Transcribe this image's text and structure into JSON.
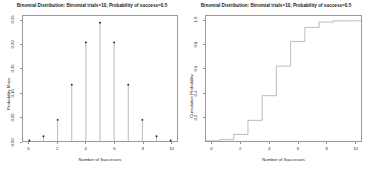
{
  "panels": [
    {
      "title": "Binomial Distribution:  Binomial trials=10, Probability of success=0.5",
      "xlabel": "Number of Successes",
      "ylabel": "Probability Mass"
    },
    {
      "title": "Binomial Distribution:  Binomial trials=10, Probability of success=0.5",
      "xlabel": "Number of Successes",
      "ylabel": "Cumulative Probability"
    }
  ],
  "chart_data": [
    {
      "type": "scatter",
      "plot_style": "stem",
      "title": "Binomial Distribution:  Binomial trials=10, Probability of success=0.5",
      "xlabel": "Number of Successes",
      "ylabel": "Probability Mass",
      "x": [
        0,
        1,
        2,
        3,
        4,
        5,
        6,
        7,
        8,
        9,
        10
      ],
      "values": [
        0.00098,
        0.00977,
        0.04395,
        0.11719,
        0.20508,
        0.24609,
        0.20508,
        0.11719,
        0.04395,
        0.00977,
        0.00098
      ],
      "xlim": [
        -0.45,
        10.45
      ],
      "ylim": [
        0.0,
        0.26
      ],
      "xticks": [
        0,
        2,
        4,
        6,
        8,
        10
      ],
      "xticklabels": [
        "0",
        "2",
        "4",
        "6",
        "8",
        "10"
      ],
      "yticks": [
        0.0,
        0.05,
        0.1,
        0.15,
        0.2,
        0.25
      ],
      "yticklabels": [
        "0.00",
        "0.05",
        "0.10",
        "0.15",
        "0.20",
        "0.25"
      ],
      "grid": false,
      "legend": "none",
      "marker": "filled-circle",
      "line_color": "#808080",
      "marker_color": "#1a1a1a"
    },
    {
      "type": "line",
      "plot_style": "step",
      "title": "Binomial Distribution:  Binomial trials=10, Probability of success=0.5",
      "xlabel": "Number of Successes",
      "ylabel": "Cumulative Probability",
      "x": [
        0,
        1,
        2,
        3,
        4,
        5,
        6,
        7,
        8,
        9,
        10
      ],
      "values": [
        0.00098,
        0.01074,
        0.05469,
        0.17188,
        0.37695,
        0.62305,
        0.82813,
        0.94531,
        0.98926,
        0.99902,
        1.0
      ],
      "xlim": [
        -0.45,
        10.45
      ],
      "ylim": [
        0.0,
        1.04
      ],
      "xticks": [
        0,
        2,
        4,
        6,
        8,
        10
      ],
      "xticklabels": [
        "0",
        "2",
        "4",
        "6",
        "8",
        "10"
      ],
      "yticks": [
        0.2,
        0.4,
        0.6,
        0.8,
        1.0
      ],
      "yticklabels": [
        "0.2",
        "0.4",
        "0.6",
        "0.8",
        "1.0"
      ],
      "grid": false,
      "legend": "none",
      "line_color": "#8c8c8c"
    }
  ]
}
